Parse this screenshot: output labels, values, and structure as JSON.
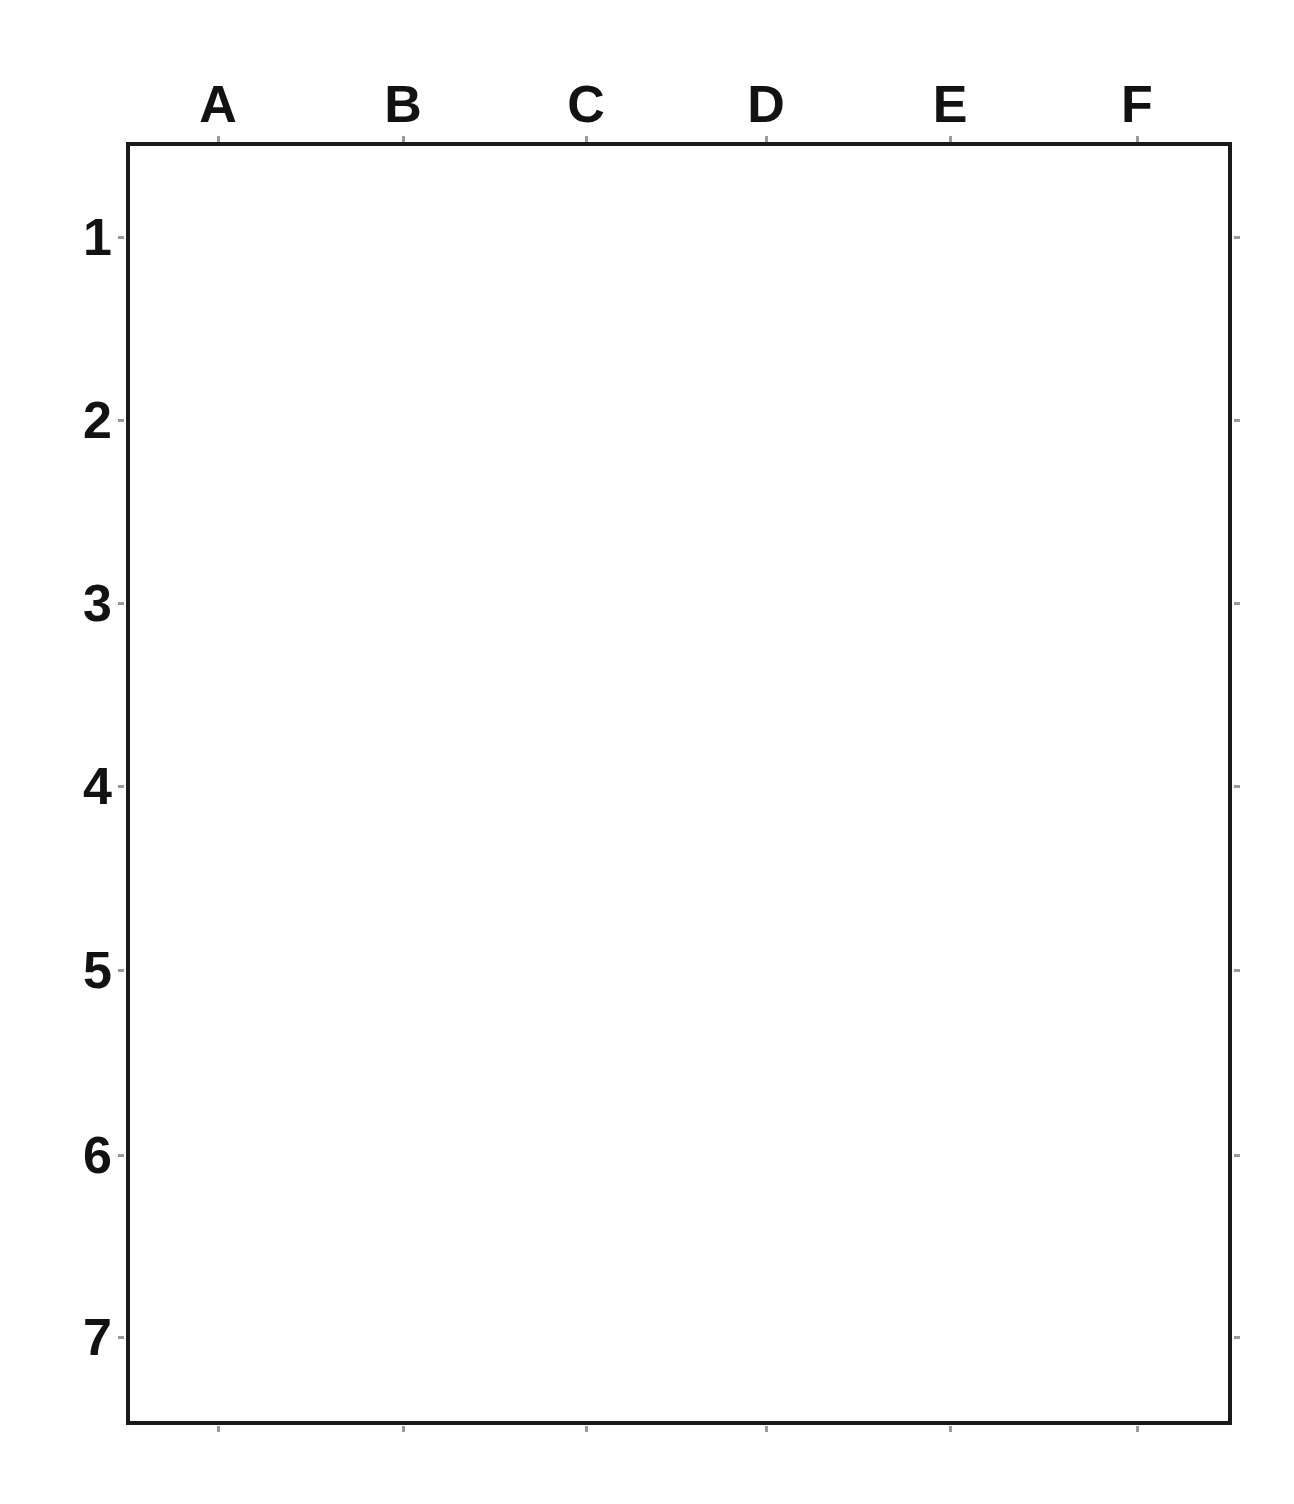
{
  "document": {
    "kind": "blank-coordinate-grid-worksheet",
    "background_color": "#ffffff",
    "line_color": "#1a1a1a",
    "guide_color": "#9b9b9b"
  },
  "grid": {
    "columns": 6,
    "rows": 7,
    "column_labels": [
      "A",
      "B",
      "C",
      "D",
      "E",
      "F"
    ],
    "row_labels": [
      "1",
      "2",
      "3",
      "4",
      "5",
      "6",
      "7"
    ],
    "cells_total": 42,
    "cell_contents": [
      [
        "",
        "",
        "",
        "",
        "",
        ""
      ],
      [
        "",
        "",
        "",
        "",
        "",
        ""
      ],
      [
        "",
        "",
        "",
        "",
        "",
        ""
      ],
      [
        "",
        "",
        "",
        "",
        "",
        ""
      ],
      [
        "",
        "",
        "",
        "",
        "",
        ""
      ],
      [
        "",
        "",
        "",
        "",
        "",
        ""
      ],
      [
        "",
        "",
        "",
        "",
        "",
        ""
      ]
    ]
  },
  "geometry": {
    "frame_left": 126,
    "frame_top": 142,
    "frame_width": 1106,
    "frame_height": 1283,
    "column_dividers_x": [
      310,
      495,
      676,
      857,
      1043
    ],
    "row_dividers_y": [
      325,
      508,
      691,
      874,
      1058,
      1241
    ],
    "column_centers_x": [
      218,
      403,
      586,
      766,
      950,
      1137
    ],
    "row_centers_y": [
      237,
      420,
      603,
      786,
      970,
      1155,
      1337
    ]
  }
}
